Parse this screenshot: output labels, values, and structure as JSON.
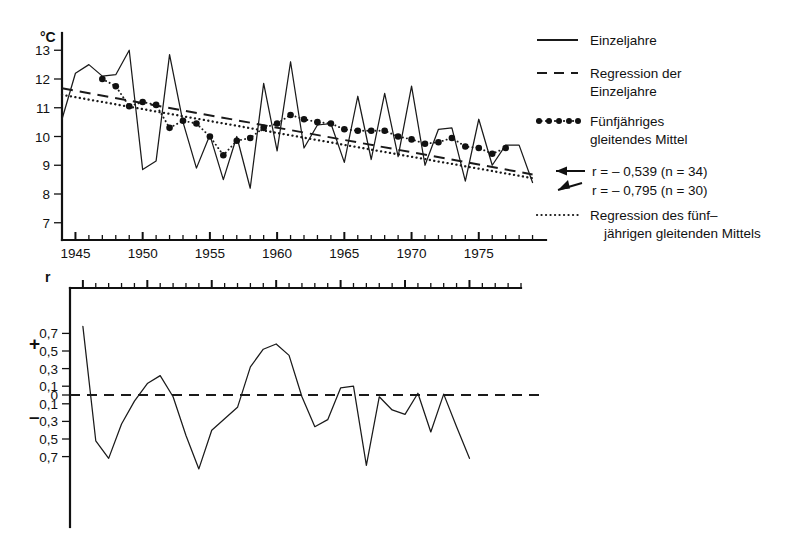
{
  "chart_data": [
    {
      "id": "temperature-panel",
      "type": "line",
      "title": "",
      "xlabel": "",
      "ylabel": "°C",
      "xlim": [
        1944,
        1980
      ],
      "ylim": [
        6.4,
        13.6
      ],
      "ytick_labels": [
        "13",
        "12",
        "11",
        "10",
        "9",
        "8",
        "7"
      ],
      "ytick_values": [
        13,
        12,
        11,
        10,
        9,
        8,
        7
      ],
      "xtick_labels": [
        "1945",
        "1950",
        "1955",
        "1960",
        "1965",
        "1970",
        "1975"
      ],
      "xtick_values": [
        1945,
        1950,
        1955,
        1960,
        1965,
        1970,
        1975
      ],
      "xtick_minor_step": 1,
      "grid": false,
      "legend_position": "right",
      "series": [
        {
          "name": "Einzeljahre",
          "style": "solid",
          "x": [
            1944,
            1945,
            1946,
            1947,
            1948,
            1949,
            1950,
            1951,
            1952,
            1953,
            1954,
            1955,
            1956,
            1957,
            1958,
            1959,
            1960,
            1961,
            1962,
            1963,
            1964,
            1965,
            1966,
            1967,
            1968,
            1969,
            1970,
            1971,
            1972,
            1973,
            1974,
            1975,
            1976,
            1977,
            1978,
            1979
          ],
          "values": [
            10.6,
            12.2,
            12.5,
            12.1,
            12.15,
            13.0,
            8.85,
            9.15,
            12.85,
            10.5,
            8.9,
            10.05,
            8.5,
            10.0,
            8.2,
            11.85,
            9.5,
            12.6,
            9.6,
            10.4,
            10.45,
            9.1,
            11.4,
            9.2,
            11.5,
            9.3,
            11.75,
            9.0,
            10.25,
            10.3,
            8.45,
            10.6,
            9.0,
            9.7,
            9.7,
            8.4
          ]
        },
        {
          "name": "Regression der Einzeljahre",
          "style": "dashed",
          "r": -0.539,
          "n": 34,
          "x": [
            1944,
            1979
          ],
          "values": [
            11.68,
            8.68
          ]
        },
        {
          "name": "Fünfjähriges gleitendes Mittel",
          "style": "dotted-markers",
          "x": [
            1947,
            1948,
            1949,
            1950,
            1951,
            1952,
            1953,
            1954,
            1955,
            1956,
            1957,
            1958,
            1959,
            1960,
            1961,
            1962,
            1963,
            1964,
            1965,
            1966,
            1967,
            1968,
            1969,
            1970,
            1971,
            1972,
            1973,
            1974,
            1975,
            1976,
            1977
          ],
          "values": [
            12.0,
            11.75,
            11.05,
            11.2,
            11.1,
            10.3,
            10.55,
            10.45,
            10.0,
            9.35,
            9.85,
            9.95,
            10.3,
            10.45,
            10.75,
            10.6,
            10.5,
            10.45,
            10.25,
            10.2,
            10.2,
            10.2,
            10.0,
            9.9,
            9.75,
            9.8,
            9.95,
            9.65,
            9.6,
            9.4,
            9.6
          ]
        },
        {
          "name": "Regression des fünfjährigen gleitenden Mittels",
          "style": "dotted",
          "r": -0.795,
          "n": 30,
          "x": [
            1944,
            1979
          ],
          "values": [
            11.45,
            8.55
          ]
        }
      ],
      "annotations": [
        {
          "id": "r-einzeljahre",
          "text": "r = – 0,539   (n = 34)"
        },
        {
          "id": "r-gleitendes-mittel",
          "text": "r = – 0,795   (n = 30)"
        }
      ]
    },
    {
      "id": "correlation-panel",
      "type": "line",
      "title": "",
      "xlabel": "",
      "ylabel": "r",
      "xlim": [
        1944,
        1979
      ],
      "ylim": [
        -0.85,
        0.85
      ],
      "ytick_labels": [
        "0,7",
        "0,5",
        "0,3",
        "0,1",
        "0",
        "0,1",
        "0,3",
        "0,5",
        "0,7"
      ],
      "ytick_values": [
        0.7,
        0.5,
        0.3,
        0.1,
        0.0,
        -0.1,
        -0.3,
        -0.5,
        -0.7
      ],
      "grid": false,
      "zero_line": 0.0,
      "sign_positive": "+",
      "sign_negative": "–",
      "series": [
        {
          "name": "r",
          "style": "solid",
          "x": [
            1945,
            1946,
            1947,
            1948,
            1949,
            1950,
            1951,
            1952,
            1953,
            1954,
            1955,
            1956,
            1957,
            1958,
            1959,
            1960,
            1961,
            1962,
            1963,
            1964,
            1965,
            1966,
            1967,
            1968,
            1969,
            1970,
            1971,
            1972,
            1973,
            1974,
            1975,
            1976,
            1977,
            1978
          ],
          "values": [
            0.78,
            -0.52,
            -0.72,
            -0.33,
            -0.07,
            0.13,
            0.22,
            -0.02,
            -0.46,
            -0.84,
            -0.4,
            -0.27,
            -0.14,
            0.32,
            0.52,
            0.58,
            0.45,
            -0.02,
            -0.36,
            -0.28,
            0.08,
            0.1,
            -0.8,
            -0.02,
            -0.17,
            -0.22,
            0.02,
            -0.42,
            0.01,
            -0.36,
            -0.72
          ]
        }
      ]
    }
  ],
  "legend": {
    "items": [
      {
        "id": "legend-einzeljahre",
        "style": "solid",
        "lines": [
          "Einzeljahre"
        ]
      },
      {
        "id": "legend-regression-einzeljahre",
        "style": "dashed",
        "lines": [
          "Regression der",
          "Einzeljahre"
        ]
      },
      {
        "id": "legend-gleitendes-mittel",
        "style": "dotted-markers",
        "lines": [
          "Fünfjähriges",
          "gleitendes Mittel"
        ]
      },
      {
        "id": "legend-regression-mittel",
        "style": "dotted",
        "lines": [
          "Regression des fünf–",
          "jährigen gleitenden Mittels"
        ]
      }
    ]
  }
}
